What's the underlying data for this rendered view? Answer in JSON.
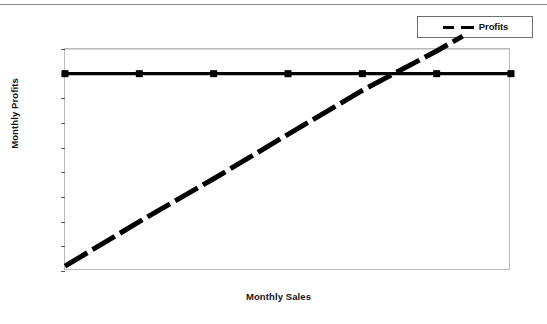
{
  "chart_data": {
    "type": "line",
    "title": "",
    "xlabel": "Monthly Sales",
    "ylabel": "Monthly Profits",
    "xlim": [
      0,
      6000
    ],
    "ylim": [
      -4000,
      500
    ],
    "grid": false,
    "legend_position": "top-right",
    "x_ticks": [
      "0",
      "1,000",
      "2,000",
      "3,000",
      "4,000",
      "5,000",
      "6,000"
    ],
    "x_tick_values": [
      0,
      1000,
      2000,
      3000,
      4000,
      5000,
      6000
    ],
    "y_ticks": [
      "500",
      "0",
      "-500",
      "-1,000",
      "-1,500",
      "-2,000",
      "-2,500",
      "-3,000",
      "-3,500",
      "-4,000"
    ],
    "y_tick_values": [
      500,
      0,
      -500,
      -1000,
      -1500,
      -2000,
      -2500,
      -3000,
      -3500,
      -4000
    ],
    "series": [
      {
        "name": "Break-even",
        "style": "solid",
        "marker": "square",
        "color": "#000000",
        "x": [
          0,
          1000,
          2000,
          3000,
          4000,
          5000,
          6000
        ],
        "values": [
          0,
          0,
          0,
          0,
          0,
          0,
          0
        ]
      },
      {
        "name": "Profits",
        "style": "dashed",
        "marker": "none",
        "color": "#000000",
        "x": [
          0,
          1000,
          2000,
          3000,
          4000,
          5000,
          5350
        ],
        "values": [
          -3900,
          -3000,
          -2130,
          -1230,
          -340,
          460,
          760
        ]
      }
    ],
    "legend": [
      {
        "label": "Profits",
        "style": "dashed",
        "color": "#000000"
      }
    ],
    "annotations": [
      {
        "text": "break-even crossing",
        "x": 5200,
        "y": 0
      }
    ]
  },
  "legend": {
    "label": "Profits"
  },
  "axes": {
    "x_title": "Monthly Sales",
    "y_title": "Monthly Profits"
  },
  "colors": {
    "line": "#000000",
    "frame": "#b9b9b9",
    "tick_text": "#141414",
    "background": "#ffffff",
    "page_rule": "#8d8d8d"
  }
}
